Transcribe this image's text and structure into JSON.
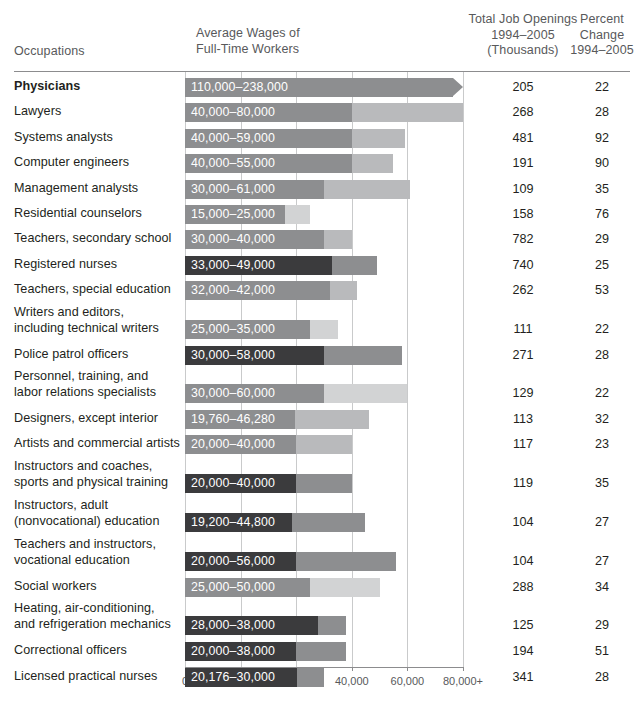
{
  "header": {
    "occupations": "Occupations",
    "wages_line1": "Average Wages of",
    "wages_line2": "Full-Time Workers",
    "openings_line1": "Total Job Openings",
    "openings_line2": "1994–2005",
    "openings_line3": "(Thousands)",
    "percent_line1": "Percent",
    "percent_line2": "Change",
    "percent_line3": "1994–2005"
  },
  "colors": {
    "bar_dark": "#3b3b3d",
    "bar_mid": "#8d8e90",
    "bar_light": "#b9babc",
    "bar_pale": "#d2d3d4",
    "grid": "#c9cacb",
    "rule": "#8c8c8e",
    "header_text": "#58595b",
    "body_text": "#231f20"
  },
  "chart_data": {
    "type": "bar",
    "title": "",
    "xlabel": "",
    "ylabel": "",
    "grid": true,
    "legend": "none",
    "axis_ticks": [
      "0",
      "10,000",
      "20,000",
      "40,000",
      "60,000",
      "80,000+"
    ],
    "axis_tick_values": [
      0,
      10000,
      20000,
      40000,
      60000,
      80000
    ],
    "axis_note": "non-linear equal-spaced scale",
    "columns": [
      "Occupations",
      "Average Wages of Full-Time Workers",
      "Total Job Openings 1994–2005 (Thousands)",
      "Percent Change 1994–2005"
    ],
    "rows": [
      {
        "occupation": "Physicians",
        "bold": true,
        "wage_label": "110,000–238,000",
        "wage_low": 110000,
        "wage_high": 238000,
        "openings": "205",
        "percent": "22",
        "overflow": true
      },
      {
        "occupation": "Lawyers",
        "bold": false,
        "wage_label": "40,000–80,000",
        "wage_low": 40000,
        "wage_high": 80000,
        "openings": "268",
        "percent": "28",
        "overflow": false
      },
      {
        "occupation": "Systems analysts",
        "bold": false,
        "wage_label": "40,000–59,000",
        "wage_low": 40000,
        "wage_high": 59000,
        "openings": "481",
        "percent": "92",
        "overflow": false
      },
      {
        "occupation": "Computer engineers",
        "bold": false,
        "wage_label": "40,000–55,000",
        "wage_low": 40000,
        "wage_high": 55000,
        "openings": "191",
        "percent": "90",
        "overflow": false
      },
      {
        "occupation": "Management analysts",
        "bold": false,
        "wage_label": "30,000–61,000",
        "wage_low": 30000,
        "wage_high": 61000,
        "openings": "109",
        "percent": "35",
        "overflow": false
      },
      {
        "occupation": "Residential counselors",
        "bold": false,
        "wage_label": "15,000–25,000",
        "wage_low": 15000,
        "wage_high": 25000,
        "openings": "158",
        "percent": "76",
        "overflow": false
      },
      {
        "occupation": "Teachers, secondary school",
        "bold": false,
        "wage_label": "30,000–40,000",
        "wage_low": 30000,
        "wage_high": 40000,
        "openings": "782",
        "percent": "29",
        "overflow": false
      },
      {
        "occupation": "Registered nurses",
        "bold": false,
        "wage_label": "33,000–49,000",
        "wage_low": 33000,
        "wage_high": 49000,
        "openings": "740",
        "percent": "25",
        "overflow": false
      },
      {
        "occupation": "Teachers, special education",
        "bold": false,
        "wage_label": "32,000–42,000",
        "wage_low": 32000,
        "wage_high": 42000,
        "openings": "262",
        "percent": "53",
        "overflow": false
      },
      {
        "occupation": "Writers and editors,\nincluding technical writers",
        "bold": false,
        "wage_label": "25,000–35,000",
        "wage_low": 25000,
        "wage_high": 35000,
        "openings": "111",
        "percent": "22",
        "overflow": false
      },
      {
        "occupation": "Police patrol officers",
        "bold": false,
        "wage_label": "30,000–58,000",
        "wage_low": 30000,
        "wage_high": 58000,
        "openings": "271",
        "percent": "28",
        "overflow": false
      },
      {
        "occupation": "Personnel, training, and\nlabor relations specialists",
        "bold": false,
        "wage_label": "30,000–60,000",
        "wage_low": 30000,
        "wage_high": 60000,
        "openings": "129",
        "percent": "22",
        "overflow": false
      },
      {
        "occupation": "Designers, except interior",
        "bold": false,
        "wage_label": "19,760–46,280",
        "wage_low": 19760,
        "wage_high": 46280,
        "openings": "113",
        "percent": "32",
        "overflow": false
      },
      {
        "occupation": "Artists and commercial artists",
        "bold": false,
        "wage_label": "20,000–40,000",
        "wage_low": 20000,
        "wage_high": 40000,
        "openings": "117",
        "percent": "23",
        "overflow": false
      },
      {
        "occupation": "Instructors and coaches,\nsports and physical training",
        "bold": false,
        "wage_label": "20,000–40,000",
        "wage_low": 20000,
        "wage_high": 40000,
        "openings": "119",
        "percent": "35",
        "overflow": false
      },
      {
        "occupation": "Instructors, adult\n(nonvocational) education",
        "bold": false,
        "wage_label": "19,200–44,800",
        "wage_low": 19200,
        "wage_high": 44800,
        "openings": "104",
        "percent": "27",
        "overflow": false
      },
      {
        "occupation": "Teachers and instructors,\nvocational education",
        "bold": false,
        "wage_label": "20,000–56,000",
        "wage_low": 20000,
        "wage_high": 56000,
        "openings": "104",
        "percent": "27",
        "overflow": false
      },
      {
        "occupation": "Social workers",
        "bold": false,
        "wage_label": "25,000–50,000",
        "wage_low": 25000,
        "wage_high": 50000,
        "openings": "288",
        "percent": "34",
        "overflow": false
      },
      {
        "occupation": "Heating, air-conditioning,\nand refrigeration mechanics",
        "bold": false,
        "wage_label": "28,000–38,000",
        "wage_low": 28000,
        "wage_high": 38000,
        "openings": "125",
        "percent": "29",
        "overflow": false
      },
      {
        "occupation": "Correctional officers",
        "bold": false,
        "wage_label": "20,000–38,000",
        "wage_low": 20000,
        "wage_high": 38000,
        "openings": "194",
        "percent": "51",
        "overflow": false
      },
      {
        "occupation": "Licensed practical nurses",
        "bold": false,
        "wage_label": "20,176–30,000",
        "wage_low": 20176,
        "wage_high": 30000,
        "openings": "341",
        "percent": "28",
        "overflow": false
      }
    ]
  }
}
